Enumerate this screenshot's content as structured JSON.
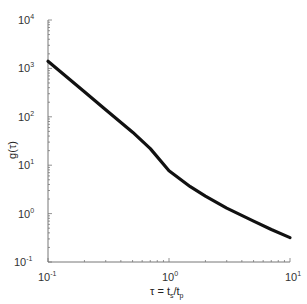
{
  "chart_data": {
    "type": "line",
    "title": "",
    "xlabel": "τ = t_s/t_p",
    "ylabel": "g(τ)",
    "xscale": "log",
    "yscale": "log",
    "xlim": [
      0.1,
      10
    ],
    "ylim": [
      0.1,
      10000
    ],
    "grid": false,
    "legend": null,
    "x_ticks": [
      "10^-1",
      "10^0",
      "10^1"
    ],
    "y_ticks": [
      "10^-1",
      "10^0",
      "10^1",
      "10^2",
      "10^3",
      "10^4"
    ],
    "series": [
      {
        "name": "g(τ)",
        "color": "#111111",
        "x": [
          0.1,
          0.2,
          0.3,
          0.5,
          0.7,
          1.0,
          1.5,
          2.0,
          3.0,
          5.0,
          7.0,
          10.0
        ],
        "y": [
          1400,
          330,
          140,
          48,
          22,
          7.7,
          3.6,
          2.3,
          1.3,
          0.7,
          0.47,
          0.32
        ]
      }
    ]
  },
  "labels": {
    "x_axis_tau": "τ = t",
    "x_axis_s": "s",
    "x_axis_slash": "/t",
    "x_axis_p": "p",
    "y_axis": "g(τ)",
    "ten": "10",
    "exp_m1": "-1",
    "exp_0": "0",
    "exp_1": "1",
    "exp_2": "2",
    "exp_3": "3",
    "exp_4": "4"
  }
}
